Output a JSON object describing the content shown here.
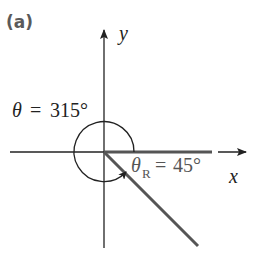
{
  "figure": {
    "panel_label": "(a)",
    "axes": {
      "x_label": "x",
      "y_label": "y"
    },
    "angle": {
      "theta_symbol": "θ",
      "equals": "=",
      "theta_value": "315°",
      "reference_symbol": "θ",
      "reference_subscript": "R",
      "reference_value": "45°"
    },
    "colors": {
      "axis": "#222222",
      "terminal_side": "#555555",
      "label_gray": "#5a5a5a"
    }
  }
}
